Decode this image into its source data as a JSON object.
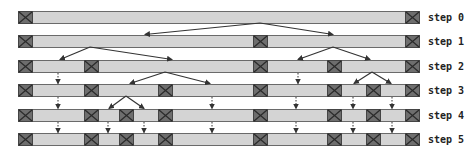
{
  "diagram": {
    "bar_left": 18,
    "bar_right": 419,
    "bar_height": 12,
    "box_width": 14,
    "colors": {
      "bar": "#d4d4d4",
      "box": "#6e6e6e",
      "line": "#333333"
    },
    "rows": [
      {
        "label": "step 0",
        "y": 11,
        "boxes": [
          18,
          405
        ]
      },
      {
        "label": "step 1",
        "y": 35,
        "boxes": [
          18,
          253,
          405
        ]
      },
      {
        "label": "step 2",
        "y": 60,
        "boxes": [
          18,
          84,
          253,
          327,
          405
        ]
      },
      {
        "label": "step 3",
        "y": 84,
        "boxes": [
          18,
          84,
          158,
          253,
          327,
          366,
          405
        ]
      },
      {
        "label": "step 4",
        "y": 109,
        "boxes": [
          18,
          84,
          119,
          158,
          253,
          327,
          366,
          405
        ]
      },
      {
        "label": "step 5",
        "y": 133,
        "boxes": [
          18,
          84,
          119,
          158,
          253,
          327,
          366,
          405
        ]
      }
    ],
    "split_arrows": [
      {
        "from": [
          260,
          23
        ],
        "to": [
          [
            145,
            35
          ],
          [
            333,
            35
          ]
        ]
      },
      {
        "from": [
          90,
          47
        ],
        "to": [
          [
            60,
            60
          ],
          [
            172,
            60
          ]
        ]
      },
      {
        "from": [
          333,
          47
        ],
        "to": [
          [
            298,
            60
          ],
          [
            370,
            60
          ]
        ]
      },
      {
        "from": [
          165,
          72
        ],
        "to": [
          [
            130,
            84
          ],
          [
            210,
            84
          ]
        ]
      },
      {
        "from": [
          372,
          72
        ],
        "to": [
          [
            354,
            84
          ],
          [
            391,
            84
          ]
        ]
      },
      {
        "from": [
          126,
          96
        ],
        "to": [
          [
            109,
            109
          ],
          [
            144,
            109
          ]
        ]
      }
    ],
    "carry_arrows": [
      {
        "from_row": 2,
        "xs": [
          58,
          298
        ]
      },
      {
        "from_row": 3,
        "xs": [
          58,
          212,
          296,
          353,
          392
        ]
      },
      {
        "from_row": 4,
        "xs": [
          58,
          108,
          144,
          212,
          296,
          353,
          392
        ]
      }
    ]
  }
}
